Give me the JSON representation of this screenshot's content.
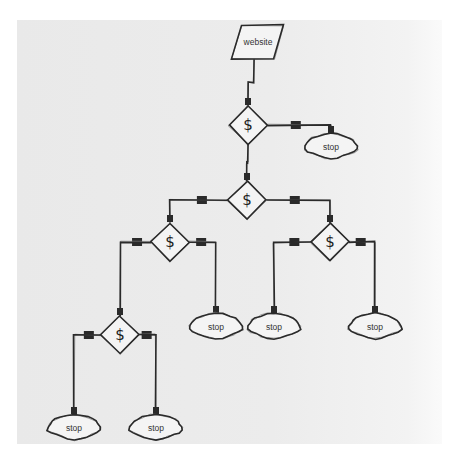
{
  "diagram": {
    "title": "",
    "colors": {
      "background": "#ececec",
      "stroke": "#2a2a2a",
      "sketch": "#888888",
      "node_fill": "#f4f4f4"
    },
    "nodes": [
      {
        "id": "website",
        "type": "parallelogram",
        "label": "website"
      },
      {
        "id": "d1",
        "type": "decision",
        "label": "$"
      },
      {
        "id": "s1",
        "type": "terminal",
        "label": "stop"
      },
      {
        "id": "d2",
        "type": "decision",
        "label": "$"
      },
      {
        "id": "d3",
        "type": "decision",
        "label": "$"
      },
      {
        "id": "d4",
        "type": "decision",
        "label": "$"
      },
      {
        "id": "d5",
        "type": "decision",
        "label": "$"
      },
      {
        "id": "s2",
        "type": "terminal",
        "label": "stop"
      },
      {
        "id": "s3",
        "type": "terminal",
        "label": "stop"
      },
      {
        "id": "s4",
        "type": "terminal",
        "label": "stop"
      },
      {
        "id": "s5",
        "type": "terminal",
        "label": "stop"
      },
      {
        "id": "s6",
        "type": "terminal",
        "label": "stop"
      }
    ],
    "edges": [
      {
        "from": "website",
        "to": "d1"
      },
      {
        "from": "d1",
        "to": "s1"
      },
      {
        "from": "d1",
        "to": "d2"
      },
      {
        "from": "d2",
        "to": "d3"
      },
      {
        "from": "d2",
        "to": "d4"
      },
      {
        "from": "d3",
        "to": "d5"
      },
      {
        "from": "d3",
        "to": "s2"
      },
      {
        "from": "d4",
        "to": "s3"
      },
      {
        "from": "d4",
        "to": "s4"
      },
      {
        "from": "d5",
        "to": "s5"
      },
      {
        "from": "d5",
        "to": "s6"
      }
    ]
  }
}
